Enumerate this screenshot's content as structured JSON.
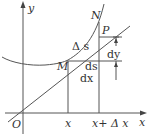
{
  "diagram": {
    "colors": {
      "stroke": "#555555",
      "text": "#333333",
      "background": "#ffffff"
    },
    "axes": {
      "x_label": "x",
      "y_label": "y",
      "origin_label": "O"
    },
    "points": {
      "M": "M",
      "P": "P",
      "N": "N"
    },
    "labels": {
      "delta_s": "Δ s",
      "ds": "ds",
      "dy": "dy",
      "dx": "dx",
      "x_tick": "x",
      "x_plus_dx_tick": "x+ Δ x"
    }
  }
}
